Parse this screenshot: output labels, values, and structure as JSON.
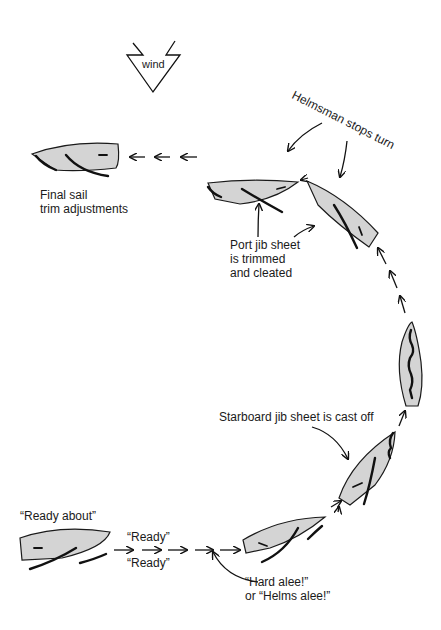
{
  "wind": {
    "label": "wind"
  },
  "labels": {
    "helmsman_stops_turn": "Helmsman stops turn",
    "final_trim_1": "Final sail",
    "final_trim_2": "trim adjustments",
    "port_jib_1": "Port jib sheet",
    "port_jib_2": "is trimmed",
    "port_jib_3": "and cleated",
    "starboard_jib": "Starboard jib sheet is cast off",
    "ready_about": "“Ready about”",
    "ready_1": "“Ready”",
    "ready_2": "“Ready”",
    "hard_alee_1": "“Hard alee!”",
    "hard_alee_2": "or “Helms alee!”"
  },
  "colors": {
    "hull_fill": "#d4d4d4",
    "ink": "#1a1a1a",
    "background": "#ffffff"
  },
  "steps": [
    "Ready about",
    "Ready / Ready",
    "Hard alee! or Helms alee!",
    "Starboard jib sheet is cast off",
    "Head to wind",
    "Port jib sheet is trimmed and cleated",
    "Helmsman stops turn",
    "Final sail trim adjustments"
  ]
}
